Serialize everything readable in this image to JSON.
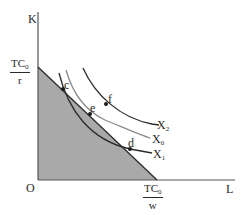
{
  "diagram": {
    "axes": {
      "y_label": "K",
      "x_label": "L",
      "origin_label": "O"
    },
    "intercepts": {
      "y_intercept": {
        "numerator": "TC",
        "numerator_sub": "0",
        "denominator": "r"
      },
      "x_intercept": {
        "numerator": "TC",
        "numerator_sub": "0",
        "denominator": "w"
      }
    },
    "curves": [
      {
        "name": "X",
        "sub": "2",
        "label": "X2"
      },
      {
        "name": "X",
        "sub": "0",
        "label": "X0"
      },
      {
        "name": "X",
        "sub": "1",
        "label": "X1"
      }
    ],
    "points": [
      {
        "label": "c"
      },
      {
        "label": "e"
      },
      {
        "label": "f"
      },
      {
        "label": "d"
      }
    ],
    "colors": {
      "feasible_region": "#a9a9a9",
      "lines": "#2a2a2a",
      "isoquant_x0": "#8a8a8a"
    }
  }
}
